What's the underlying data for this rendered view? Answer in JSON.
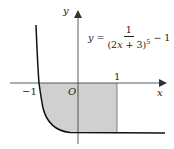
{
  "diagram": {
    "type": "function-graph",
    "equation": {
      "lhs": "y",
      "equals": "=",
      "numerator": "1",
      "denominator_base": "(2x + 3)",
      "denominator_exponent": "5",
      "tail": "− 1"
    },
    "axes": {
      "x_label": "x",
      "y_label": "y",
      "origin_label": "O"
    },
    "tick_labels": {
      "neg_one": "−1",
      "one": "1"
    },
    "shaded_region": {
      "x_from": -1,
      "x_to": 1,
      "description": "Region between curve, x-axis, x = 1"
    },
    "colors": {
      "curve": "#111111",
      "axis": "#333333",
      "shade": "#d0d0d0"
    }
  }
}
